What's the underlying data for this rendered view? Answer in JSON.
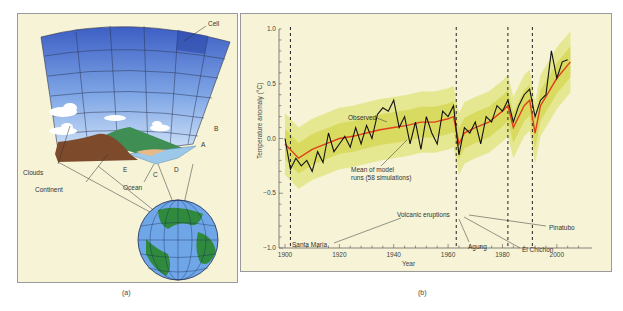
{
  "panels": {
    "a": {
      "caption": "(a)",
      "labels": {
        "cell": "Cell",
        "clouds": "Clouds",
        "continent": "Continent",
        "ocean": "Ocean",
        "a": "A",
        "b": "B",
        "c": "C",
        "d": "D",
        "e": "E"
      }
    },
    "b": {
      "caption": "(b)",
      "annotations": {
        "observed": "Observed",
        "mean_line1": "Mean of model",
        "mean_line2": "runs (58 simulations)",
        "volcanic": "Volcanic eruptions",
        "santa_maria": "Santa Maria",
        "agung": "Agung",
        "el_chichon": "El Chichon",
        "pinatubo": "Pinatubo"
      }
    }
  },
  "chart_data": {
    "type": "line",
    "title": "",
    "xlabel": "Year",
    "ylabel": "Temperature anomaly (°C)",
    "xlim": [
      1900,
      2010
    ],
    "ylim": [
      -1.0,
      1.0
    ],
    "xticks": [
      "1900",
      "1920",
      "1940",
      "1960",
      "1980",
      "2000"
    ],
    "yticks": [
      "1.0",
      "0.5",
      "0.0",
      "−0.5",
      "−1.0"
    ],
    "grid": false,
    "legend": "inline annotations",
    "colors": {
      "observed": "#111111",
      "model_mean": "#e0401a",
      "simulations": "#d8dc5a",
      "background": "#f6f3d6"
    },
    "volcanic_eruptions": [
      {
        "name": "Santa Maria",
        "year": 1902
      },
      {
        "name": "Agung",
        "year": 1963
      },
      {
        "name": "El Chichon",
        "year": 1982
      },
      {
        "name": "Pinatubo",
        "year": 1991
      }
    ],
    "series": [
      {
        "name": "Observed",
        "x": [
          1900,
          1902,
          1904,
          1906,
          1908,
          1910,
          1912,
          1914,
          1916,
          1918,
          1920,
          1922,
          1924,
          1926,
          1928,
          1930,
          1932,
          1934,
          1936,
          1938,
          1940,
          1942,
          1944,
          1946,
          1948,
          1950,
          1952,
          1954,
          1956,
          1958,
          1960,
          1962,
          1964,
          1966,
          1968,
          1970,
          1972,
          1974,
          1976,
          1978,
          1980,
          1982,
          1984,
          1986,
          1988,
          1990,
          1992,
          1994,
          1996,
          1998,
          2000,
          2002,
          2004
        ],
        "values": [
          0.0,
          -0.28,
          -0.18,
          -0.25,
          -0.2,
          -0.3,
          -0.12,
          -0.22,
          0.05,
          -0.12,
          -0.05,
          0.02,
          -0.08,
          0.1,
          -0.05,
          0.12,
          0.0,
          0.22,
          0.28,
          0.25,
          0.35,
          0.1,
          0.2,
          -0.05,
          0.15,
          -0.1,
          0.2,
          0.05,
          -0.05,
          0.25,
          0.2,
          0.3,
          -0.15,
          0.1,
          0.05,
          0.15,
          -0.05,
          0.2,
          0.15,
          0.3,
          0.25,
          0.35,
          0.15,
          0.3,
          0.4,
          0.45,
          0.2,
          0.35,
          0.4,
          0.8,
          0.55,
          0.7,
          0.72
        ]
      },
      {
        "name": "Mean of model runs (58 simulations)",
        "x": [
          1900,
          1905,
          1910,
          1915,
          1920,
          1925,
          1930,
          1935,
          1940,
          1945,
          1950,
          1955,
          1960,
          1962,
          1964,
          1966,
          1970,
          1975,
          1980,
          1982,
          1984,
          1988,
          1990,
          1992,
          1994,
          2000,
          2005
        ],
        "values": [
          -0.05,
          -0.18,
          -0.1,
          -0.05,
          0.0,
          0.02,
          0.05,
          0.08,
          0.1,
          0.12,
          0.15,
          0.15,
          0.18,
          0.2,
          -0.05,
          0.05,
          0.1,
          0.15,
          0.25,
          0.3,
          0.1,
          0.3,
          0.35,
          0.05,
          0.3,
          0.55,
          0.7
        ]
      }
    ]
  }
}
